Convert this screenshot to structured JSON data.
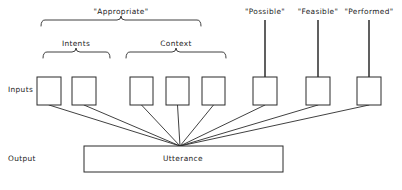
{
  "figure": {
    "type": "diagram",
    "background_color": "#ffffff",
    "line_color": "#2b2b2b",
    "text_color": "#1a1a1a"
  },
  "row_labels": {
    "inputs": "Inputs",
    "output": "Output"
  },
  "top_brace": {
    "label": "\"Appropriate\"",
    "label_x": 121,
    "label_y": 14,
    "x_left": 41,
    "x_right": 201,
    "y_top": 20,
    "y_bottom": 26,
    "apex_x": 121
  },
  "sub_braces": [
    {
      "name": "intents",
      "label": "Intents",
      "label_x": 76,
      "label_y": 46,
      "x_left": 43,
      "x_right": 110,
      "y_top": 52,
      "y_bottom": 58,
      "apex_x": 76
    },
    {
      "name": "context",
      "label": "Context",
      "label_x": 176,
      "label_y": 46,
      "x_left": 126,
      "x_right": 226,
      "y_top": 52,
      "y_bottom": 58,
      "apex_x": 176
    }
  ],
  "stem_labels": [
    {
      "name": "possible",
      "label": "\"Possible\"",
      "label_x": 265,
      "label_y": 14,
      "stem_x": 265,
      "stem_y_top": 20,
      "stem_y_bottom": 77
    },
    {
      "name": "feasible",
      "label": "\"Feasible\"",
      "label_x": 318,
      "label_y": 14,
      "stem_x": 318,
      "stem_y_top": 20,
      "stem_y_bottom": 77
    },
    {
      "name": "performed",
      "label": "\"Performed\"",
      "label_x": 369,
      "label_y": 14,
      "stem_x": 369,
      "stem_y_top": 20,
      "stem_y_bottom": 77
    }
  ],
  "input_boxes": [
    {
      "name": "intent-box-1",
      "x": 37,
      "y": 77,
      "w": 24,
      "h": 28
    },
    {
      "name": "intent-box-2",
      "x": 72,
      "y": 77,
      "w": 24,
      "h": 28
    },
    {
      "name": "context-box-1",
      "x": 130,
      "y": 77,
      "w": 23,
      "h": 28
    },
    {
      "name": "context-box-2",
      "x": 166,
      "y": 77,
      "w": 23,
      "h": 28
    },
    {
      "name": "context-box-3",
      "x": 202,
      "y": 77,
      "w": 23,
      "h": 28
    },
    {
      "name": "possible-box",
      "x": 253,
      "y": 77,
      "w": 24,
      "h": 28
    },
    {
      "name": "feasible-box",
      "x": 306,
      "y": 77,
      "w": 24,
      "h": 28
    },
    {
      "name": "performed-box",
      "x": 357,
      "y": 77,
      "w": 24,
      "h": 28
    }
  ],
  "output_box": {
    "name": "utterance-box",
    "label": "Utterance",
    "x": 84,
    "y": 146,
    "w": 199,
    "h": 26,
    "label_x": 183,
    "label_y": 161
  },
  "convergence_point": {
    "x": 180,
    "y": 146
  },
  "labels_positions": {
    "inputs_x": 8,
    "inputs_y": 92,
    "output_x": 8,
    "output_y": 161
  }
}
